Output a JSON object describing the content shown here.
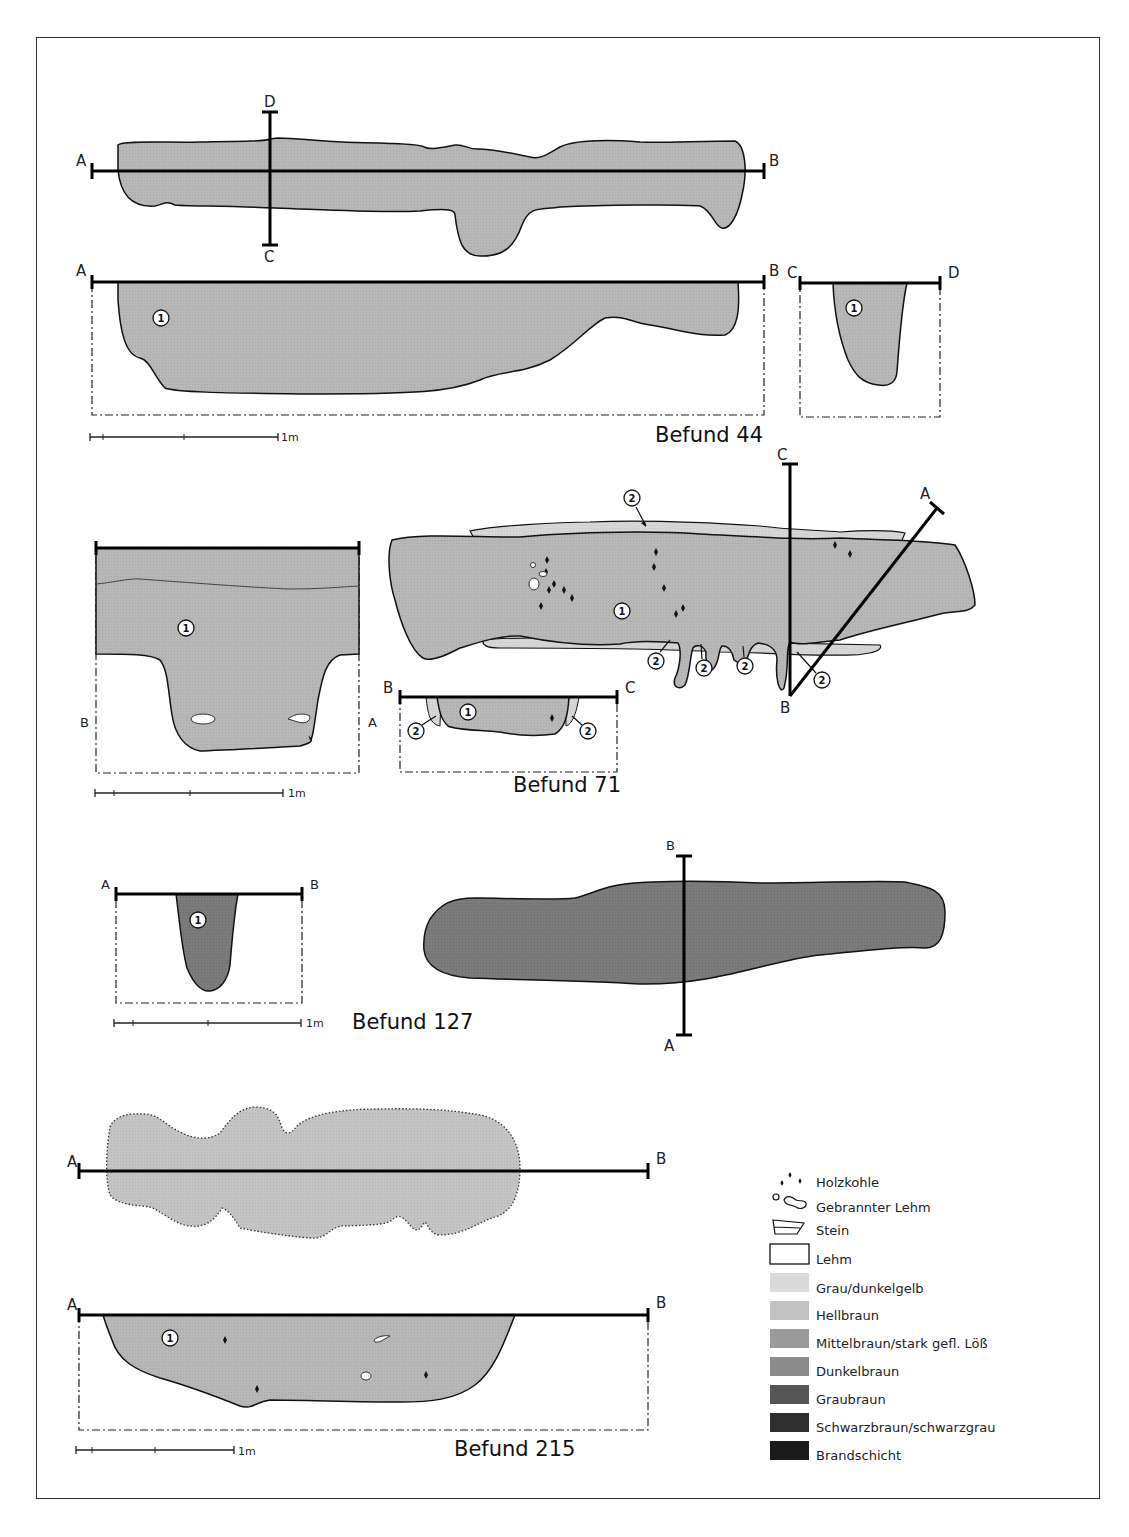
{
  "figures": {
    "befund44": {
      "title": "Befund 44",
      "plan": {
        "section_line_1": [
          "A",
          "B"
        ],
        "section_line_2": [
          "D",
          "C"
        ]
      },
      "section_ab": {
        "labels": [
          "A",
          "B"
        ],
        "layers": [
          "1"
        ]
      },
      "section_cd": {
        "labels": [
          "C",
          "D"
        ],
        "layers": [
          "1"
        ]
      },
      "scale": "1m"
    },
    "befund71": {
      "title": "Befund 71",
      "profile_ab": {
        "labels": [
          "B",
          "A"
        ],
        "layers": [
          "1"
        ]
      },
      "plan": {
        "labels": [
          "A",
          "B",
          "C"
        ],
        "layers": [
          "1",
          "2",
          "2",
          "2",
          "2",
          "2"
        ]
      },
      "section_bc": {
        "labels": [
          "B",
          "C"
        ],
        "layers": [
          "1",
          "2",
          "2"
        ]
      },
      "scale": "1m"
    },
    "befund127": {
      "title": "Befund 127",
      "section_ab": {
        "labels": [
          "A",
          "B"
        ],
        "layers": [
          "1"
        ]
      },
      "plan": {
        "labels": [
          "B",
          "A"
        ]
      },
      "scale": "1m"
    },
    "befund215": {
      "title": "Befund 215",
      "plan": {
        "labels": [
          "A",
          "B"
        ]
      },
      "section_ab": {
        "labels": [
          "A",
          "B"
        ],
        "layers": [
          "1"
        ]
      },
      "scale": "1m"
    }
  },
  "legend": {
    "items": [
      {
        "label": "Holzkohle",
        "symbol": "charcoal-dots"
      },
      {
        "label": "Gebrannter Lehm",
        "symbol": "burnt-clay-blobs"
      },
      {
        "label": "Stein",
        "symbol": "stone"
      },
      {
        "label": "Lehm",
        "symbol": "empty-box",
        "color": "#ffffff"
      },
      {
        "label": "Grau/dunkelgelb",
        "color": "#dadada"
      },
      {
        "label": "Hellbraun",
        "color": "#c2c2c2"
      },
      {
        "label": "Mittelbraun/stark gefl. Löß",
        "color": "#9a9a9a"
      },
      {
        "label": "Dunkelbraun",
        "color": "#8c8c8c"
      },
      {
        "label": "Graubraun",
        "color": "#555555"
      },
      {
        "label": "Schwarzbraun/schwarzgrau",
        "color": "#2e2e2e"
      },
      {
        "label": "Brandschicht",
        "color": "#1a1a1a"
      }
    ]
  },
  "colors": {
    "fill_medium": "#b7b7b7",
    "fill_light": "#d6d6d6",
    "fill_dark": "#7b7b7b",
    "fill_plan215": "#c4c4c4"
  }
}
